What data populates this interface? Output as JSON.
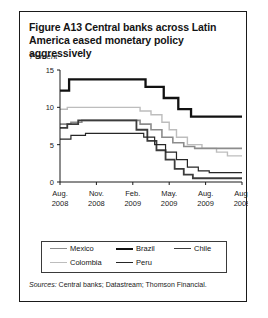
{
  "figure": {
    "title": "Figure A13  Central banks across Latin America eased monetary policy aggressively",
    "title_line1": "Figure A13  Central banks across Latin",
    "title_line2": "America eased monetary policy aggressively",
    "sources_label": "Sources:",
    "sources_text": " Central banks; Datastream; Thomson Financial."
  },
  "legend": {
    "row1": [
      {
        "name": "Mexico",
        "color": "#8c8c8c",
        "width": 1.6
      },
      {
        "name": "Brazil",
        "color": "#111111",
        "width": 2.3
      },
      {
        "name": "Chile",
        "color": "#3c3c3c",
        "width": 1.8
      }
    ],
    "row2": [
      {
        "name": "Colombia",
        "color": "#bdbdbd",
        "width": 1.4
      },
      {
        "name": "Peru",
        "color": "#262626",
        "width": 1.2
      }
    ]
  },
  "chart_data": {
    "type": "line",
    "title": "Central banks across Latin America eased monetary policy aggressively",
    "xlabel": "",
    "ylabel": "Percent",
    "ylim": [
      0,
      15
    ],
    "yticks": [
      0,
      5,
      10,
      15
    ],
    "grid": false,
    "legend_position": "bottom",
    "x_tick_labels": [
      {
        "line1": "Aug.",
        "line2": "2008"
      },
      {
        "line1": "Nov.",
        "line2": "2008"
      },
      {
        "line1": "Feb.",
        "line2": "2009"
      },
      {
        "line1": "May.",
        "line2": "2009"
      },
      {
        "line1": "Aug.",
        "line2": "2009"
      },
      {
        "line1": "Aug.",
        "line2": "2009"
      }
    ],
    "x_range": [
      0,
      100
    ],
    "x_tick_positions": [
      0,
      20,
      40,
      60,
      80,
      100
    ],
    "series": [
      {
        "name": "Brazil",
        "color": "#111111",
        "width": 2.3,
        "x": [
          0,
          5,
          5,
          47,
          47,
          57,
          57,
          65,
          65,
          72,
          72,
          100
        ],
        "values": [
          12.25,
          12.25,
          13.75,
          13.75,
          12.75,
          12.75,
          11.25,
          11.25,
          9.75,
          9.75,
          8.75,
          8.75
        ]
      },
      {
        "name": "Colombia",
        "color": "#bdbdbd",
        "width": 1.4,
        "x": [
          0,
          4,
          4,
          44,
          44,
          50,
          50,
          56,
          56,
          60,
          60,
          64,
          64,
          70,
          70,
          78,
          78,
          86,
          86,
          92,
          92,
          100
        ],
        "values": [
          9.75,
          9.75,
          10.0,
          10.0,
          9.5,
          9.5,
          9.0,
          9.0,
          8.0,
          8.0,
          7.0,
          7.0,
          6.0,
          6.0,
          5.0,
          5.0,
          4.5,
          4.5,
          4.0,
          4.0,
          3.5,
          3.5
        ]
      },
      {
        "name": "Mexico",
        "color": "#8c8c8c",
        "width": 1.6,
        "x": [
          0,
          6,
          6,
          12,
          12,
          44,
          44,
          50,
          50,
          56,
          56,
          62,
          62,
          68,
          68,
          74,
          74,
          100
        ],
        "values": [
          7.75,
          7.75,
          8.0,
          8.0,
          8.25,
          8.25,
          7.75,
          7.75,
          7.0,
          7.0,
          6.0,
          6.0,
          5.25,
          5.25,
          4.75,
          4.75,
          4.5,
          4.5
        ]
      },
      {
        "name": "Chile",
        "color": "#3c3c3c",
        "width": 1.8,
        "x": [
          0,
          4,
          4,
          10,
          10,
          42,
          42,
          48,
          48,
          53,
          53,
          58,
          58,
          63,
          63,
          68,
          68,
          73,
          73,
          100
        ],
        "values": [
          7.25,
          7.25,
          7.75,
          7.75,
          8.25,
          8.25,
          7.0,
          7.0,
          5.5,
          5.5,
          4.25,
          4.25,
          3.0,
          3.0,
          1.75,
          1.75,
          1.0,
          1.0,
          0.5,
          0.5
        ]
      },
      {
        "name": "Peru",
        "color": "#262626",
        "width": 1.2,
        "x": [
          0,
          6,
          6,
          14,
          14,
          46,
          46,
          52,
          52,
          58,
          58,
          64,
          64,
          70,
          70,
          76,
          76,
          82,
          82,
          100
        ],
        "values": [
          5.75,
          5.75,
          6.25,
          6.25,
          6.5,
          6.5,
          6.0,
          6.0,
          5.0,
          5.0,
          4.0,
          4.0,
          3.0,
          3.0,
          2.0,
          2.0,
          1.5,
          1.5,
          1.25,
          1.25
        ]
      }
    ]
  }
}
